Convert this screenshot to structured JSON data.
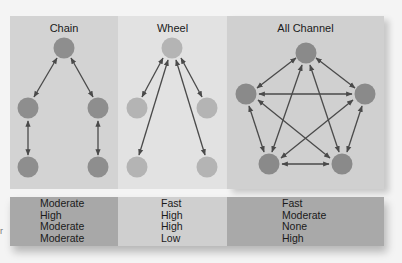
{
  "panels": [
    {
      "title": "Chain",
      "node_color": "#8e8e8e"
    },
    {
      "title": "Wheel",
      "node_color": "#b4b4b4"
    },
    {
      "title": "All Channel",
      "node_color": "#8a8a8a"
    }
  ],
  "table": {
    "columns": [
      {
        "values": [
          "Moderate",
          "High",
          "Moderate",
          "Moderate"
        ]
      },
      {
        "values": [
          "Fast",
          "High",
          "High",
          "Low"
        ]
      },
      {
        "values": [
          "Fast",
          "Moderate",
          "None",
          "High"
        ]
      }
    ]
  },
  "edge_fragment": "r",
  "colors": {
    "arrow": "#4a4a4a",
    "background": "#f4f4f4"
  }
}
